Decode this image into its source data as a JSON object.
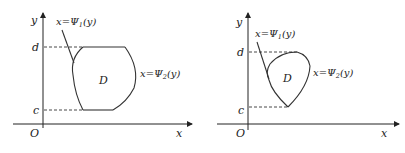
{
  "diagrams": [
    {
      "name": "left",
      "axis_y_label": "y",
      "axis_x_label": "x",
      "origin_label": "O",
      "d_label": "d",
      "c_label": "c",
      "region_label": "D",
      "psi1_label": "x=Ψ",
      "psi1_sub": "1",
      "psi1_arg": "(y)",
      "psi2_label": "x=Ψ",
      "psi2_sub": "2",
      "psi2_arg": "(y)"
    },
    {
      "name": "right",
      "axis_y_label": "y",
      "axis_x_label": "x",
      "origin_label": "O",
      "d_label": "d",
      "c_label": "c",
      "region_label": "D",
      "psi1_label": "x=Ψ",
      "psi1_sub": "1",
      "psi1_arg": "(y)",
      "psi2_label": "x=Ψ",
      "psi2_sub": "2",
      "psi2_arg": "(y)"
    }
  ],
  "colors": {
    "stroke": "#333333",
    "background": "#ffffff"
  }
}
